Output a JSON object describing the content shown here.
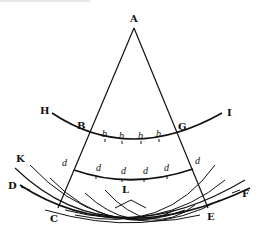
{
  "diagram": {
    "points": {
      "A": "A",
      "B": "B",
      "G": "G",
      "H": "H",
      "I": "I",
      "K": "K",
      "D": "D",
      "C": "C",
      "E": "E",
      "F": "F",
      "L": "L"
    },
    "small_labels": {
      "b": [
        "b",
        "b",
        "b",
        "b"
      ],
      "d": [
        "d",
        "d",
        "d",
        "d",
        "d",
        "d"
      ]
    },
    "colors": {
      "ink": "#111111",
      "background": "#ffffff"
    }
  }
}
